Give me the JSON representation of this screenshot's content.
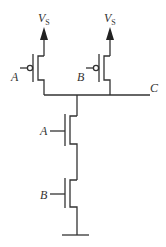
{
  "diagram": {
    "supply_label": "V",
    "supply_subscript": "S",
    "inputs": [
      "A",
      "B"
    ],
    "output_label": "C",
    "pmos_inputs": [
      "A",
      "B"
    ],
    "nmos_inputs": [
      "A",
      "B"
    ],
    "colors": {
      "stroke": "#333333",
      "background": "#ffffff"
    }
  }
}
